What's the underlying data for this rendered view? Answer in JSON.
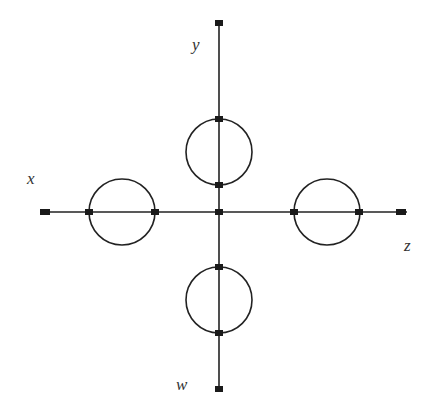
{
  "diagram": {
    "type": "feynman-like graph",
    "labels": {
      "x": "x",
      "y": "y",
      "z": "z",
      "w": "w"
    },
    "colors": {
      "line": "#222222",
      "node": "#1a1a1a",
      "label": "#333333"
    },
    "center": {
      "x": 219,
      "y": 212
    },
    "endpoints": {
      "x": {
        "x": 45,
        "y": 212
      },
      "z": {
        "x": 401,
        "y": 212
      },
      "y": {
        "x": 219,
        "y": 23
      },
      "w": {
        "x": 219,
        "y": 389
      }
    },
    "loops": [
      {
        "name": "left-loop",
        "cx": 122,
        "cy": 212,
        "r": 33
      },
      {
        "name": "right-loop",
        "cx": 327,
        "cy": 212,
        "r": 33
      },
      {
        "name": "top-loop",
        "cx": 219,
        "cy": 152,
        "r": 33
      },
      {
        "name": "bottom-loop",
        "cx": 219,
        "cy": 300,
        "r": 33
      }
    ]
  }
}
